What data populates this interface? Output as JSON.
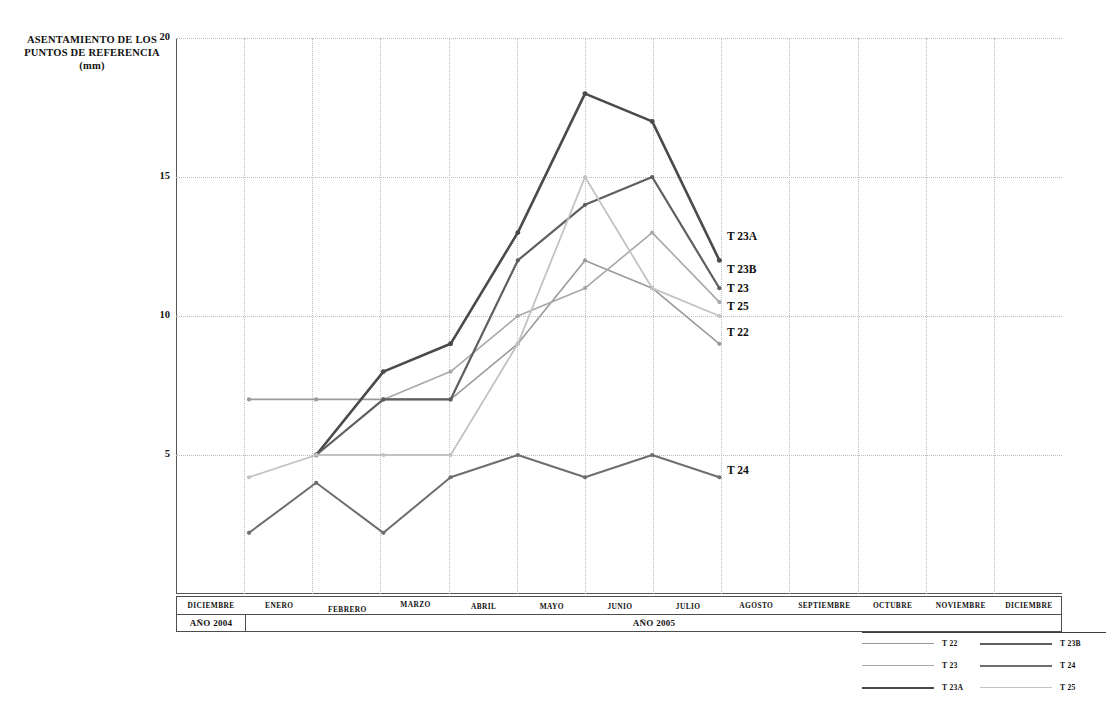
{
  "axis": {
    "y_title_line1": "ASENTAMIENTO DE LOS",
    "y_title_line2": "PUNTOS DE REFERENCIA",
    "y_title_unit": "(mm)",
    "yticks": [
      "20",
      "15",
      "10",
      "5"
    ]
  },
  "months": [
    {
      "label": "DICIEMBRE"
    },
    {
      "label": "ENERO"
    },
    {
      "label": "FEBRERO"
    },
    {
      "label": "MARZO"
    },
    {
      "label": "ABRIL"
    },
    {
      "label": "MAYO"
    },
    {
      "label": "JUNIO"
    },
    {
      "label": "JULIO"
    },
    {
      "label": "AGOSTO"
    },
    {
      "label": "SEPTIEMBRE"
    },
    {
      "label": "OCTUBRE"
    },
    {
      "label": "NOVIEMBRE"
    },
    {
      "label": "DICIEMBRE"
    }
  ],
  "years": [
    {
      "label": "AÑO 2004"
    },
    {
      "label": "AÑO 2005"
    }
  ],
  "end_labels": [
    {
      "name": "T 23A"
    },
    {
      "name": "T 23B"
    },
    {
      "name": "T 23"
    },
    {
      "name": "T 25"
    },
    {
      "name": "T 22"
    },
    {
      "name": "T 24"
    }
  ],
  "legend": {
    "column_left": [
      {
        "name": "T 22",
        "color": "#9a9a9a",
        "width": 1.4
      },
      {
        "name": "T 23",
        "color": "#a8a8a8",
        "width": 1.4
      },
      {
        "name": "T 23A",
        "color": "#4a4a4a",
        "width": 2.6
      }
    ],
    "column_right": [
      {
        "name": "T 23B",
        "color": "#5e5e5e",
        "width": 2.2
      },
      {
        "name": "T 24",
        "color": "#6e6e6e",
        "width": 2.0
      },
      {
        "name": "T 25",
        "color": "#c2c2c2",
        "width": 1.6
      }
    ]
  },
  "chart_data": {
    "type": "line",
    "title": "",
    "xlabel": "",
    "ylabel": "ASENTAMIENTO DE LOS PUNTOS DE REFERENCIA (mm)",
    "ylim": [
      0,
      20
    ],
    "yticks": [
      5,
      10,
      15,
      20
    ],
    "grid": true,
    "legend_position": "bottom-right",
    "categories": [
      "DICIEMBRE",
      "ENERO",
      "FEBRERO",
      "MARZO",
      "ABRIL",
      "MAYO",
      "JUNIO",
      "JULIO",
      "AGOSTO",
      "SEPTIEMBRE",
      "OCTUBRE",
      "NOVIEMBRE",
      "DICIEMBRE"
    ],
    "series": [
      {
        "name": "T 22",
        "color": "#9a9a9a",
        "width": 1.6,
        "points": [
          {
            "x": 0,
            "y": 7
          },
          {
            "x": 1,
            "y": 7
          },
          {
            "x": 2,
            "y": 7
          },
          {
            "x": 3,
            "y": 7
          },
          {
            "x": 4,
            "y": 9
          },
          {
            "x": 5,
            "y": 12
          },
          {
            "x": 6,
            "y": 11
          },
          {
            "x": 7,
            "y": 9
          }
        ]
      },
      {
        "name": "T 23",
        "color": "#a8a8a8",
        "width": 1.6,
        "points": [
          {
            "x": 2,
            "y": 7
          },
          {
            "x": 3,
            "y": 8
          },
          {
            "x": 4,
            "y": 10
          },
          {
            "x": 5,
            "y": 11
          },
          {
            "x": 6,
            "y": 13
          },
          {
            "x": 7,
            "y": 10.5
          }
        ]
      },
      {
        "name": "T 23A",
        "color": "#4a4a4a",
        "width": 2.6,
        "points": [
          {
            "x": 1,
            "y": 5
          },
          {
            "x": 2,
            "y": 8
          },
          {
            "x": 3,
            "y": 9
          },
          {
            "x": 4,
            "y": 13
          },
          {
            "x": 5,
            "y": 18
          },
          {
            "x": 6,
            "y": 17
          },
          {
            "x": 7,
            "y": 12
          }
        ]
      },
      {
        "name": "T 23B",
        "color": "#5e5e5e",
        "width": 2.2,
        "points": [
          {
            "x": 1,
            "y": 5
          },
          {
            "x": 2,
            "y": 7
          },
          {
            "x": 3,
            "y": 7
          },
          {
            "x": 4,
            "y": 12
          },
          {
            "x": 5,
            "y": 14
          },
          {
            "x": 6,
            "y": 15
          },
          {
            "x": 7,
            "y": 11
          }
        ]
      },
      {
        "name": "T 24",
        "color": "#6e6e6e",
        "width": 2.0,
        "points": [
          {
            "x": 0,
            "y": 2.2
          },
          {
            "x": 1,
            "y": 4
          },
          {
            "x": 2,
            "y": 2.2
          },
          {
            "x": 3,
            "y": 4.2
          },
          {
            "x": 4,
            "y": 5
          },
          {
            "x": 5,
            "y": 4.2
          },
          {
            "x": 6,
            "y": 5
          },
          {
            "x": 7,
            "y": 4.2
          }
        ]
      },
      {
        "name": "T 25",
        "color": "#c2c2c2",
        "width": 1.8,
        "points": [
          {
            "x": 0,
            "y": 4.2
          },
          {
            "x": 1,
            "y": 5
          },
          {
            "x": 2,
            "y": 5
          },
          {
            "x": 3,
            "y": 5
          },
          {
            "x": 4,
            "y": 9
          },
          {
            "x": 5,
            "y": 15
          },
          {
            "x": 6,
            "y": 11
          },
          {
            "x": 7,
            "y": 10
          }
        ]
      }
    ]
  }
}
